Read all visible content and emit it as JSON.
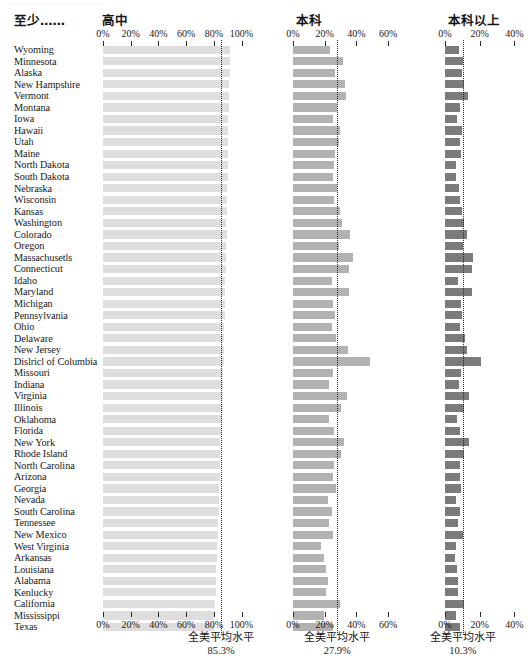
{
  "top_fragment": "·······························",
  "headers": {
    "row_label": "至少……",
    "panel1": "高中",
    "panel2": "本科",
    "panel3": "本科以上"
  },
  "footer_label": "全美平均水平",
  "colors": {
    "panel1_bar": "#dedede",
    "panel2_bar": "#b2b2b2",
    "panel3_bar": "#7b7b7b",
    "avg_line": "#2a2a2a",
    "text": "#1a1a1a"
  },
  "chart_data": [
    {
      "type": "bar",
      "title": "高中",
      "orientation": "horizontal",
      "xlabel": "",
      "ylabel": "",
      "xlim": [
        0,
        100
      ],
      "ticks": [
        0,
        20,
        40,
        60,
        80,
        100
      ],
      "ticklabels": [
        "0%",
        "20%",
        "40%",
        "60%",
        "80%",
        "100%"
      ],
      "grid": false,
      "reference_line": {
        "label": "全美平均水平",
        "value": 85.3,
        "value_label": "85.3%"
      },
      "categories": [
        "Wyoming",
        "Minnesota",
        "Alaska",
        "New Hampshire",
        "Vermont",
        "Montana",
        "Iowa",
        "Hawaii",
        "Utah",
        "Maine",
        "North Dakota",
        "South Dakota",
        "Nebraska",
        "Wisconsin",
        "Kansas",
        "Washington",
        "Colorado",
        "Oregon",
        "Massachusetls",
        "Connecticut",
        "Idaho",
        "Maryland",
        "Michigan",
        "Pennsylvania",
        "Ohio",
        "Delaware",
        "New Jersey",
        "Dislricl of Columbia",
        "Missouri",
        "Indiana",
        "Virginia",
        "Illinois",
        "Oklahoma",
        "Florida",
        "New York",
        "Rhode Island",
        "North Carolina",
        "Arizona",
        "Georgia",
        "Nevada",
        "South Carolina",
        "Tennessee",
        "New Mexico",
        "West Virginia",
        "Arkansas",
        "Louisiana",
        "Alabama",
        "Kenlucky",
        "California",
        "Mississippi",
        "Texas"
      ],
      "values": [
        91.8,
        91.5,
        91.4,
        91.3,
        91.0,
        90.8,
        90.5,
        90.4,
        90.4,
        90.2,
        90.1,
        89.9,
        89.8,
        89.4,
        89.2,
        89.1,
        89.3,
        89.1,
        88.7,
        88.6,
        88.4,
        88.2,
        88.0,
        87.9,
        87.6,
        87.4,
        87.4,
        87.1,
        86.8,
        86.6,
        86.6,
        86.4,
        86.2,
        85.5,
        84.7,
        84.7,
        84.3,
        84.2,
        83.9,
        83.9,
        83.6,
        83.1,
        82.8,
        82.4,
        82.4,
        81.6,
        81.4,
        81.7,
        80.6,
        80.4,
        79.9
      ]
    },
    {
      "type": "bar",
      "title": "本科",
      "orientation": "horizontal",
      "xlabel": "",
      "ylabel": "",
      "xlim": [
        0,
        70
      ],
      "ticks": [
        0,
        20,
        40,
        60
      ],
      "ticklabels": [
        "0%",
        "20%",
        "40%",
        "60%"
      ],
      "grid": false,
      "reference_line": {
        "label": "全美平均水平",
        "value": 27.9,
        "value_label": "27.9%"
      },
      "categories": [
        "Wyoming",
        "Minnesota",
        "Alaska",
        "New Hampshire",
        "Vermont",
        "Montana",
        "Iowa",
        "Hawaii",
        "Utah",
        "Maine",
        "North Dakota",
        "South Dakota",
        "Nebraska",
        "Wisconsin",
        "Kansas",
        "Washington",
        "Colorado",
        "Oregon",
        "Massachusetls",
        "Connecticut",
        "Idaho",
        "Maryland",
        "Michigan",
        "Pennsylvania",
        "Ohio",
        "Delaware",
        "New Jersey",
        "Dislricl of Columbia",
        "Missouri",
        "Indiana",
        "Virginia",
        "Illinois",
        "Oklahoma",
        "Florida",
        "New York",
        "Rhode Island",
        "North Carolina",
        "Arizona",
        "Georgia",
        "Nevada",
        "South Carolina",
        "Tennessee",
        "New Mexico",
        "West Virginia",
        "Arkansas",
        "Louisiana",
        "Alabama",
        "Kenlucky",
        "California",
        "Mississippi",
        "Texas"
      ],
      "values": [
        23.4,
        31.3,
        26.6,
        32.5,
        33.4,
        28.0,
        25.0,
        29.5,
        29.0,
        26.7,
        25.6,
        25.1,
        27.6,
        26.1,
        29.7,
        31.2,
        35.7,
        29.1,
        38.0,
        35.3,
        24.4,
        35.5,
        25.0,
        26.5,
        24.3,
        27.3,
        34.4,
        48.5,
        25.0,
        22.6,
        34.0,
        30.3,
        22.6,
        25.9,
        32.0,
        30.0,
        26.1,
        25.5,
        27.3,
        21.9,
        24.4,
        22.9,
        25.4,
        17.5,
        19.3,
        20.8,
        21.9,
        20.7,
        29.9,
        19.6,
        25.5
      ]
    },
    {
      "type": "bar",
      "title": "本科以上",
      "orientation": "horizontal",
      "xlabel": "",
      "ylabel": "",
      "xlim": [
        0,
        45
      ],
      "ticks": [
        0,
        20,
        40
      ],
      "ticklabels": [
        "0%",
        "20%",
        "40%"
      ],
      "grid": false,
      "reference_line": {
        "label": "全美平均水平",
        "value": 10.3,
        "value_label": "10.3%"
      },
      "categories": [
        "Wyoming",
        "Minnesota",
        "Alaska",
        "New Hampshire",
        "Vermont",
        "Montana",
        "Iowa",
        "Hawaii",
        "Utah",
        "Maine",
        "North Dakota",
        "South Dakota",
        "Nebraska",
        "Wisconsin",
        "Kansas",
        "Washington",
        "Colorado",
        "Oregon",
        "Massachusetls",
        "Connecticut",
        "Idaho",
        "Maryland",
        "Michigan",
        "Pennsylvania",
        "Ohio",
        "Delaware",
        "New Jersey",
        "Dislricl of Columbia",
        "Missouri",
        "Indiana",
        "Virginia",
        "Illinois",
        "Oklahoma",
        "Florida",
        "New York",
        "Rhode Island",
        "North Carolina",
        "Arizona",
        "Georgia",
        "Nevada",
        "South Carolina",
        "Tennessee",
        "New Mexico",
        "West Virginia",
        "Arkansas",
        "Louisiana",
        "Alabama",
        "Kenlucky",
        "California",
        "Mississippi",
        "Texas"
      ],
      "values": [
        7.9,
        10.3,
        9.6,
        10.9,
        13.3,
        8.7,
        7.1,
        9.9,
        8.6,
        9.1,
        6.6,
        6.5,
        8.3,
        8.7,
        9.8,
        11.1,
        12.7,
        10.1,
        16.4,
        15.5,
        7.5,
        15.7,
        9.4,
        9.9,
        8.4,
        11.4,
        12.7,
        21.0,
        9.4,
        8.2,
        13.8,
        11.0,
        6.8,
        8.9,
        14.0,
        10.8,
        8.5,
        8.5,
        9.5,
        6.6,
        8.4,
        7.5,
        10.6,
        6.1,
        5.9,
        6.7,
        7.7,
        7.7,
        10.7,
        6.5,
        8.5
      ]
    }
  ]
}
